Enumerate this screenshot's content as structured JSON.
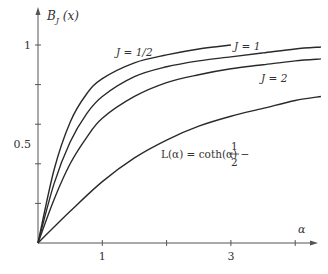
{
  "chart_data": {
    "type": "line",
    "title": "",
    "xlabel": "α",
    "ylabel": "B_J(x)",
    "xlim": [
      0,
      4.4
    ],
    "ylim": [
      0,
      1.1
    ],
    "grid": false,
    "x_ticks": [
      1,
      2,
      3,
      4
    ],
    "x_tick_labels": [
      "1",
      "",
      "3",
      ""
    ],
    "y_ticks": [
      0.2,
      0.4,
      0.6,
      0.8,
      1.0
    ],
    "y_tick_labels": [
      {
        "value": 1.0,
        "text": "1"
      },
      {
        "value": 0.5,
        "text": "0.5"
      }
    ],
    "series": [
      {
        "name": "J = 1/2",
        "label": "J = 1/2",
        "J": 0.5,
        "x_max": 3.0,
        "x": [
          0,
          0.25,
          0.5,
          0.75,
          1.0,
          1.5,
          2.0,
          2.5,
          3.0
        ],
        "values": [
          0,
          0.37,
          0.61,
          0.75,
          0.83,
          0.91,
          0.95,
          0.98,
          1.0
        ]
      },
      {
        "name": "J = 1",
        "label": "J = 1",
        "J": 1,
        "x_max": 4.4,
        "x": [
          0,
          0.25,
          0.5,
          0.75,
          1.0,
          1.5,
          2.0,
          2.5,
          3.0,
          3.5,
          4.0,
          4.4
        ],
        "values": [
          0,
          0.3,
          0.51,
          0.65,
          0.74,
          0.84,
          0.89,
          0.92,
          0.94,
          0.96,
          0.98,
          0.99
        ]
      },
      {
        "name": "J = 2",
        "label": "J = 2",
        "J": 2,
        "x_max": 4.4,
        "x": [
          0,
          0.25,
          0.5,
          0.75,
          1.0,
          1.5,
          2.0,
          2.5,
          3.0,
          3.5,
          4.0,
          4.4
        ],
        "values": [
          0,
          0.22,
          0.4,
          0.53,
          0.63,
          0.74,
          0.81,
          0.85,
          0.88,
          0.9,
          0.92,
          0.93
        ]
      },
      {
        "name": "L(α) = coth(α) − 1/α",
        "label": "L(α) = coth(α) − 1/2",
        "J": "∞",
        "x_max": 4.4,
        "x": [
          0,
          0.5,
          1.0,
          1.5,
          2.0,
          2.5,
          3.0,
          3.5,
          4.0,
          4.4
        ],
        "values": [
          0,
          0.16,
          0.31,
          0.43,
          0.52,
          0.59,
          0.64,
          0.68,
          0.72,
          0.74
        ]
      }
    ],
    "annotations": [
      {
        "text": "J = 1/2",
        "near_series": "J = 1/2"
      },
      {
        "text": "J = 1",
        "near_series": "J = 1"
      },
      {
        "text": "J = 2",
        "near_series": "J = 2"
      },
      {
        "text": "L(α) = coth(α) − ",
        "fraction": {
          "num": "1",
          "den": "2"
        },
        "near_series": "L(α)"
      }
    ]
  }
}
